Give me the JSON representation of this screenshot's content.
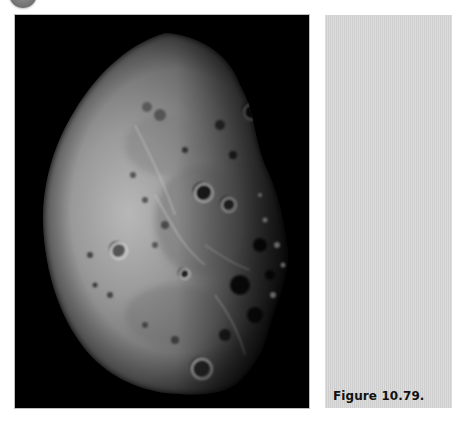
{
  "figure": {
    "caption": "Figure 10.79.",
    "image_alt": "Telescopic photograph of the Moon near the terminator showing craters and maria",
    "panel_color": "#d6d6d6",
    "photo_background": "#000000"
  }
}
